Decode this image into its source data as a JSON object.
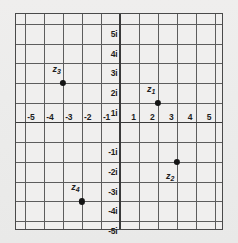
{
  "figure": {
    "background_color": "#ececeb",
    "plot_background_color": "#f0efee",
    "grid_color": "#5d5d5d",
    "axis_color": "#3a3a3a",
    "point_color": "#141414"
  },
  "chart_data": {
    "type": "scatter",
    "title": "",
    "xlabel": "",
    "ylabel": "",
    "xlim": [
      -5.5,
      5.5
    ],
    "ylim": [
      -5.5,
      5.5
    ],
    "grid": true,
    "legend": "none",
    "x_tick_labels": [
      "-5",
      "-4",
      "-3",
      "-2",
      "-1",
      "1",
      "2",
      "3",
      "4",
      "5"
    ],
    "x_tick_values": [
      -5,
      -4,
      -3,
      -2,
      -1,
      1,
      2,
      3,
      4,
      5
    ],
    "y_tick_labels": [
      "5i",
      "4i",
      "3i",
      "2i",
      "1i",
      "-1i",
      "-2i",
      "-3i",
      "-4i",
      "-5i"
    ],
    "y_tick_values": [
      5,
      4,
      3,
      2,
      1,
      -1,
      -2,
      -3,
      -4,
      -5
    ],
    "points": [
      {
        "name": "z1",
        "label_main": "z",
        "label_sub": "1",
        "x": 2,
        "y": 1,
        "label_dx": -0.35,
        "label_dy": 0.72
      },
      {
        "name": "z2",
        "label_main": "z",
        "label_sub": "2",
        "x": 3,
        "y": -2,
        "label_dx": -0.35,
        "label_dy": -0.72
      },
      {
        "name": "z3",
        "label_main": "z",
        "label_sub": "3",
        "x": -3,
        "y": 2,
        "label_dx": -0.35,
        "label_dy": 0.72
      },
      {
        "name": "z4",
        "label_main": "z",
        "label_sub": "4",
        "x": -2,
        "y": -4,
        "label_dx": -0.35,
        "label_dy": 0.72
      }
    ]
  }
}
